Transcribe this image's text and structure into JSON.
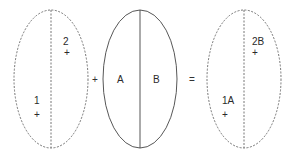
{
  "diagram": {
    "left_ellipse": {
      "style": "dashed",
      "labels": [
        {
          "text": "2",
          "marker": "+"
        },
        {
          "text": "1",
          "marker": "+"
        }
      ]
    },
    "operator_plus": "+",
    "middle_ellipse": {
      "style": "solid",
      "labels": [
        {
          "text": "A"
        },
        {
          "text": "B"
        }
      ]
    },
    "operator_equals": "=",
    "right_ellipse": {
      "style": "dashed",
      "labels": [
        {
          "text": "2B",
          "marker": "+"
        },
        {
          "text": "1A",
          "marker": "+"
        }
      ]
    },
    "colors": {
      "stroke": "#555555",
      "text": "#2a2a2a",
      "background": "#ffffff"
    }
  }
}
